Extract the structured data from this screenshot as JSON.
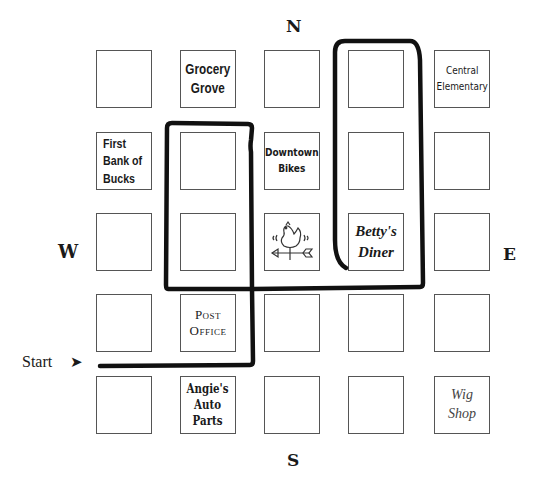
{
  "compass": {
    "north": "N",
    "south": "S",
    "east": "E",
    "west": "W"
  },
  "start": {
    "label": "Start",
    "arrow_icon": "arrow-right-icon"
  },
  "grid": {
    "rows": 5,
    "cols": 5,
    "blocks": [
      {
        "row": 0,
        "col": 0,
        "label": ""
      },
      {
        "row": 0,
        "col": 1,
        "label": "Grocery\nGrove"
      },
      {
        "row": 0,
        "col": 2,
        "label": ""
      },
      {
        "row": 0,
        "col": 3,
        "label": ""
      },
      {
        "row": 0,
        "col": 4,
        "label": "Central\nElementary"
      },
      {
        "row": 1,
        "col": 0,
        "label": "First\nBank of\nBucks"
      },
      {
        "row": 1,
        "col": 1,
        "label": ""
      },
      {
        "row": 1,
        "col": 2,
        "label": "Downtown\nBikes"
      },
      {
        "row": 1,
        "col": 3,
        "label": ""
      },
      {
        "row": 1,
        "col": 4,
        "label": ""
      },
      {
        "row": 2,
        "col": 0,
        "label": ""
      },
      {
        "row": 2,
        "col": 1,
        "label": ""
      },
      {
        "row": 2,
        "col": 2,
        "label": "",
        "icon": "weathervane-rooster-icon"
      },
      {
        "row": 2,
        "col": 3,
        "label": "Betty's\nDiner"
      },
      {
        "row": 2,
        "col": 4,
        "label": ""
      },
      {
        "row": 3,
        "col": 0,
        "label": ""
      },
      {
        "row": 3,
        "col": 1,
        "label": "Post\nOffice"
      },
      {
        "row": 3,
        "col": 2,
        "label": ""
      },
      {
        "row": 3,
        "col": 3,
        "label": ""
      },
      {
        "row": 3,
        "col": 4,
        "label": ""
      },
      {
        "row": 4,
        "col": 0,
        "label": ""
      },
      {
        "row": 4,
        "col": 1,
        "label": "Angie's\nAuto\nParts"
      },
      {
        "row": 4,
        "col": 2,
        "label": ""
      },
      {
        "row": 4,
        "col": 3,
        "label": ""
      },
      {
        "row": 4,
        "col": 4,
        "label": "Wig\nShop"
      }
    ]
  },
  "route": {
    "color": "#111111",
    "description": "Path from Start east, north, loops around west block column and Betty's Diner column"
  }
}
